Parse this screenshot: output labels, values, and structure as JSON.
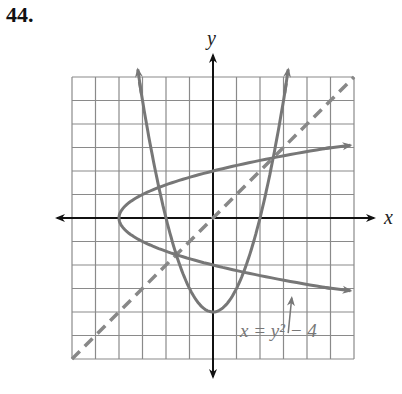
{
  "problem_number": "44.",
  "chart_data": {
    "type": "line",
    "title": "",
    "xlabel": "x",
    "ylabel": "y",
    "xlim": [
      -6,
      6
    ],
    "ylim": [
      -6,
      6
    ],
    "grid": true,
    "grid_step": 1,
    "series": [
      {
        "name": "y = x^2 - 4",
        "style": "solid",
        "color": "#777777",
        "description": "upward parabola, vertex (0,-4)"
      },
      {
        "name": "x = y^2 - 4",
        "style": "solid",
        "color": "#777777",
        "description": "sideways parabola, vertex (-4,0)"
      },
      {
        "name": "y = x",
        "style": "dashed",
        "color": "#888888",
        "description": "line of symmetry"
      }
    ],
    "annotations": [
      {
        "text": "x = y² − 4",
        "points_to": "x = y^2 - 4",
        "position": [
          1.2,
          -5
        ]
      }
    ]
  },
  "axis": {
    "x_label": "x",
    "y_label": "y"
  },
  "annotation": {
    "label": "x = y² − 4"
  }
}
